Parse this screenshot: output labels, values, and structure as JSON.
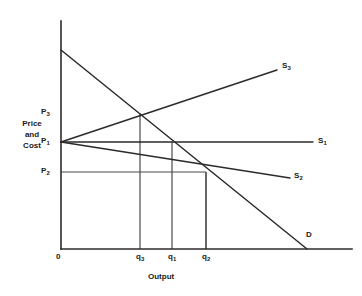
{
  "figure": {
    "background_color": "#ffffff",
    "line_color": "#2b2b2b",
    "guide_color": "#4a4a4a",
    "width": 362,
    "height": 296
  },
  "axes": {
    "y_title_line1": "Price",
    "y_title_line2": "and",
    "y_title_line3": "Cost",
    "x_title": "Output",
    "origin_label": "0"
  },
  "price_ticks": [
    {
      "id": "p3",
      "label": "P",
      "sub": "3"
    },
    {
      "id": "p1",
      "label": "P",
      "sub": "1"
    },
    {
      "id": "p2",
      "label": "P",
      "sub": "2"
    }
  ],
  "quantity_ticks": [
    {
      "id": "q3",
      "label": "q",
      "sub": "3"
    },
    {
      "id": "q1",
      "label": "q",
      "sub": "1"
    },
    {
      "id": "q2",
      "label": "q",
      "sub": "2"
    }
  ],
  "curve_labels": [
    {
      "id": "s3",
      "label": "S",
      "sub": "3"
    },
    {
      "id": "s1",
      "label": "S",
      "sub": "1"
    },
    {
      "id": "s2",
      "label": "S",
      "sub": "2"
    },
    {
      "id": "d",
      "label": "D",
      "sub": ""
    }
  ],
  "chart_data": {
    "type": "line",
    "title": "",
    "xlabel": "Output",
    "ylabel": "Price and Cost",
    "grid": false,
    "legend": "inline-end-of-line",
    "axis_origin": {
      "x": 61,
      "y": 249
    },
    "axis_y_top": {
      "x": 61,
      "y": 21
    },
    "axis_x_right": {
      "x": 352,
      "y": 249
    },
    "price_levels": {
      "P1": {
        "pixel_y": 142,
        "description": "competitive / constant-cost price level"
      },
      "P2": {
        "pixel_y": 172,
        "description": "lower price where decreasing-cost supply meets demand"
      },
      "P3": {
        "pixel_y": 113,
        "description": "higher price where increasing-cost supply meets demand"
      }
    },
    "quantity_levels": {
      "q3": {
        "pixel_x": 140,
        "description": "output under increasing-cost supply S3"
      },
      "q1": {
        "pixel_x": 172,
        "description": "output under constant-cost supply S1"
      },
      "q2": {
        "pixel_x": 206,
        "description": "output under decreasing-cost supply S2"
      }
    },
    "series": [
      {
        "name": "D",
        "role": "demand",
        "slope": "negative",
        "points": [
          [
            61,
            50
          ],
          [
            307,
            249
          ]
        ],
        "label_position": [
          306,
          231
        ]
      },
      {
        "name": "S1",
        "role": "supply-constant-cost",
        "slope": "zero",
        "points": [
          [
            61,
            142
          ],
          [
            313,
            142
          ]
        ],
        "label_position": [
          318,
          137
        ]
      },
      {
        "name": "S2",
        "role": "supply-decreasing-cost",
        "slope": "negative",
        "points": [
          [
            61,
            142
          ],
          [
            290,
            178
          ]
        ],
        "label_position": [
          294,
          172
        ]
      },
      {
        "name": "S3",
        "role": "supply-increasing-cost",
        "slope": "positive",
        "points": [
          [
            61,
            142
          ],
          [
            277,
            70
          ]
        ],
        "label_position": [
          282,
          62
        ]
      }
    ],
    "equilibria": [
      {
        "name": "S3 x D",
        "price": "P3",
        "quantity": "q3",
        "pixel": [
          140,
          113
        ]
      },
      {
        "name": "S1 x D",
        "price": "P1",
        "quantity": "q1",
        "pixel": [
          172,
          142
        ]
      },
      {
        "name": "S2 x D",
        "price": "P2",
        "quantity": "q2",
        "pixel": [
          206,
          172
        ]
      }
    ],
    "guide_lines": [
      {
        "from": [
          61,
          113
        ],
        "to": [
          140,
          113
        ],
        "type": "horizontal",
        "at": "P3"
      },
      {
        "from": [
          140,
          113
        ],
        "to": [
          140,
          249
        ],
        "type": "vertical",
        "at": "q3"
      },
      {
        "from": [
          172,
          142
        ],
        "to": [
          172,
          249
        ],
        "type": "vertical",
        "at": "q1"
      },
      {
        "from": [
          61,
          172
        ],
        "to": [
          206,
          172
        ],
        "type": "horizontal",
        "at": "P2"
      },
      {
        "from": [
          206,
          172
        ],
        "to": [
          206,
          249
        ],
        "type": "vertical",
        "at": "q2"
      }
    ]
  }
}
